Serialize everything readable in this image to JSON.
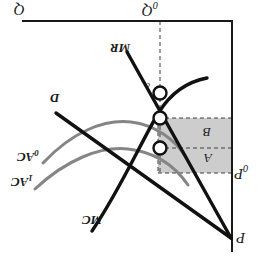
{
  "figure": {
    "type": "economics-diagram",
    "orientation_degrees": 180,
    "axes": {
      "vertical_axis_label": "P",
      "horizontal_axis_label": "Q",
      "price_marker_label": "P₀",
      "quantity_marker_label": "Q₀"
    },
    "curves": [
      {
        "id": "demand",
        "label": "D",
        "color": "#1a1a1a"
      },
      {
        "id": "marginal-revenue",
        "label": "MR",
        "color": "#1a1a1a"
      },
      {
        "id": "marginal-cost",
        "label": "MC",
        "color": "#1a1a1a"
      },
      {
        "id": "average-cost-0",
        "label": "AC₀",
        "color": "#808080"
      },
      {
        "id": "average-cost-1",
        "label": "AC₁",
        "color": "#808080"
      }
    ],
    "areas": [
      {
        "id": "area-b",
        "label": "B",
        "fill": "#cccccc"
      },
      {
        "id": "area-a",
        "label": "A",
        "fill": "#cccccc"
      }
    ],
    "points": [
      {
        "id": "point-c",
        "label": "c"
      }
    ],
    "labels": {
      "q_axis": "Q",
      "q0": "Q",
      "q0_sub": "0",
      "p_axis": "P",
      "p0": "P",
      "p0_sub": "0",
      "demand": "D",
      "mr": "MR",
      "mc": "MC",
      "ac0": "AC",
      "ac0_sub": "0",
      "ac1": "AC",
      "ac1_sub": "1",
      "area_a": "A",
      "area_b": "B",
      "point_c": "c"
    },
    "colors": {
      "axis": "#1a1a1a",
      "black_curve": "#1a1a1a",
      "gray_curve": "#808080",
      "shade": "#cccccc",
      "dashed": "#4d4d4d",
      "marker_fill": "#ffffff"
    }
  }
}
